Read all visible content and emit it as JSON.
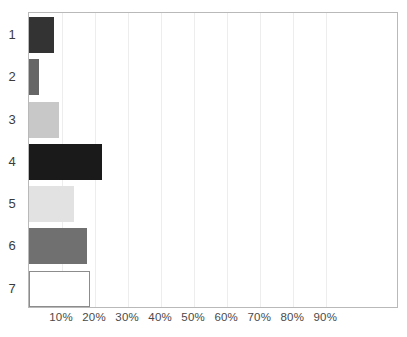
{
  "chart_data": {
    "type": "bar",
    "orientation": "horizontal",
    "title": "",
    "xlabel": "",
    "ylabel": "",
    "categories": [
      "1",
      "2",
      "3",
      "4",
      "5",
      "6",
      "7"
    ],
    "values": [
      7.5,
      3.0,
      9.0,
      22.0,
      13.5,
      17.5,
      18.5
    ],
    "value_suffix": "%",
    "xlim": [
      0,
      112
    ],
    "xticks": [
      10,
      20,
      30,
      40,
      50,
      60,
      70,
      80,
      90
    ],
    "xtick_labels": [
      "10%",
      "20%",
      "30%",
      "40%",
      "50%",
      "60%",
      "70%",
      "80%",
      "90%"
    ],
    "grid": {
      "vertical": true,
      "horizontal": false,
      "color": "#ededed"
    },
    "legend": {
      "visible": false,
      "position": "none",
      "entries": []
    },
    "bar_styles": [
      {
        "category": "1",
        "fill": "#333333",
        "border": "#333333"
      },
      {
        "category": "2",
        "fill": "#666666",
        "border": "#666666"
      },
      {
        "category": "3",
        "fill": "#c8c8c8",
        "border": "#c8c8c8"
      },
      {
        "category": "4",
        "fill": "#1a1a1a",
        "border": "#1a1a1a"
      },
      {
        "category": "5",
        "fill": "#e2e2e2",
        "border": "#e2e2e2"
      },
      {
        "category": "6",
        "fill": "#707070",
        "border": "#707070"
      },
      {
        "category": "7",
        "fill": "#ffffff",
        "border": "#8c8c8c"
      }
    ],
    "frame_color": "#b9b9b9",
    "background": "#ffffff",
    "annotations": []
  },
  "layout": {
    "plot_left": 28,
    "plot_top": 12,
    "plot_width": 370,
    "plot_height": 296,
    "px_per_percent": 3.3035714,
    "bar_height": 36,
    "row_height": 42.2857,
    "row_offset": 4
  }
}
